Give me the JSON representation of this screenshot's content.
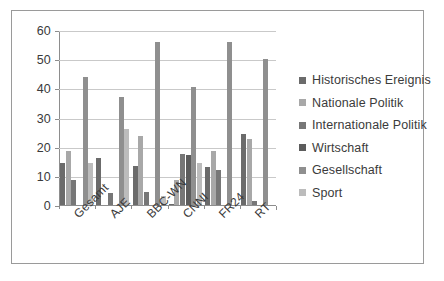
{
  "chart_data": {
    "type": "bar",
    "title": "",
    "subtitle": "",
    "xlabel": "",
    "ylabel": "",
    "ylim": [
      0,
      60
    ],
    "yticks": [
      0,
      10,
      20,
      30,
      40,
      50,
      60
    ],
    "grid": true,
    "legend_position": "right",
    "categories": [
      "Gesamt",
      "AJE",
      "BBC-WN",
      "CNNI",
      "FR24",
      "RT"
    ],
    "series": [
      {
        "name": "Historisches Ereignis",
        "color": "#6b6b6b",
        "values": [
          14.5,
          16.0,
          13.5,
          0.5,
          13.0,
          24.5
        ]
      },
      {
        "name": "Nationale Politik",
        "color": "#a8a8a8",
        "values": [
          18.5,
          0,
          23.5,
          8.5,
          18.5,
          22.5
        ]
      },
      {
        "name": "Internationale Politik",
        "color": "#777777",
        "values": [
          8.5,
          4.0,
          4.5,
          17.5,
          12.0,
          1.5
        ]
      },
      {
        "name": "Wirtschaft",
        "color": "#5c5c5c",
        "values": [
          0,
          0,
          0,
          17.0,
          0,
          0
        ]
      },
      {
        "name": "Gesellschaft",
        "color": "#8f8f8f",
        "values": [
          44.0,
          37.0,
          56.0,
          40.5,
          56.0,
          50.0
        ]
      },
      {
        "name": "Sport",
        "color": "#bcbcbc",
        "values": [
          14.5,
          26.0,
          3.0,
          14.5,
          0,
          0
        ]
      }
    ]
  },
  "legend": {
    "items": [
      {
        "label": "Historisches Ereignis"
      },
      {
        "label": "Nationale Politik"
      },
      {
        "label": "Internationale Politik"
      },
      {
        "label": "Wirtschaft"
      },
      {
        "label": "Gesellschaft"
      },
      {
        "label": "Sport"
      }
    ]
  }
}
